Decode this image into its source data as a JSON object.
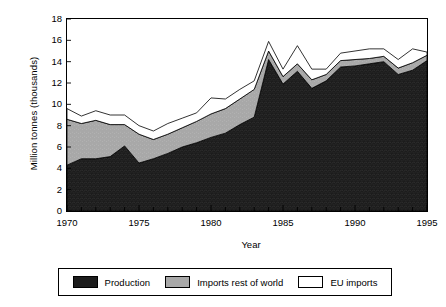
{
  "chart_data": {
    "type": "area",
    "stacked": true,
    "title": "",
    "xlabel": "Year",
    "ylabel": "Million tonnes (thousands)",
    "x": [
      1970,
      1971,
      1972,
      1973,
      1974,
      1975,
      1976,
      1977,
      1978,
      1979,
      1980,
      1981,
      1982,
      1983,
      1984,
      1985,
      1986,
      1987,
      1988,
      1989,
      1990,
      1991,
      1992,
      1993,
      1994,
      1995
    ],
    "xlim": [
      1970,
      1995
    ],
    "ylim": [
      0,
      18
    ],
    "ytick_labels": [
      "0",
      "2",
      "4",
      "6",
      "8",
      "10",
      "12",
      "14",
      "16",
      "18"
    ],
    "yticks": [
      0,
      2,
      4,
      6,
      8,
      10,
      12,
      14,
      16,
      18
    ],
    "xtick_labels": [
      "1970",
      "1975",
      "1980",
      "1985",
      "1990",
      "1995"
    ],
    "xticks": [
      1970,
      1975,
      1980,
      1985,
      1990,
      1995
    ],
    "xtick_minor_step": 1,
    "grid": false,
    "legend_position": "bottom",
    "series": [
      {
        "name": "Production",
        "color": "#1c1c1c",
        "values": [
          4.3,
          4.9,
          4.9,
          5.1,
          6.1,
          4.5,
          4.9,
          5.4,
          6.0,
          6.4,
          6.9,
          7.3,
          8.1,
          8.8,
          14.2,
          11.9,
          13.1,
          11.5,
          12.2,
          13.5,
          13.6,
          13.8,
          14.0,
          12.8,
          13.2,
          14.1
        ]
      },
      {
        "name": "Imports rest of world",
        "color": "#a8a8a8",
        "values": [
          4.3,
          3.3,
          3.6,
          3.0,
          2.0,
          2.7,
          1.8,
          1.8,
          1.8,
          2.0,
          2.2,
          2.3,
          2.4,
          2.6,
          0.8,
          0.7,
          0.7,
          0.8,
          0.6,
          0.6,
          0.6,
          0.5,
          0.5,
          0.6,
          0.7,
          0.5
        ]
      },
      {
        "name": "EU imports",
        "color": "#ffffff",
        "values": [
          1.0,
          0.7,
          0.9,
          0.9,
          0.9,
          0.8,
          0.8,
          1.0,
          0.9,
          0.8,
          1.5,
          0.9,
          0.9,
          0.8,
          0.9,
          0.7,
          1.7,
          1.0,
          0.5,
          0.7,
          0.8,
          0.9,
          0.7,
          0.8,
          1.3,
          0.3
        ]
      }
    ],
    "totals": [
      9.6,
      8.9,
      9.4,
      9.0,
      9.0,
      8.0,
      7.5,
      8.2,
      8.7,
      9.2,
      10.6,
      10.5,
      11.4,
      12.2,
      15.9,
      13.3,
      15.5,
      13.3,
      13.3,
      14.8,
      15.0,
      14.2,
      15.2,
      14.2,
      15.2,
      14.9
    ]
  },
  "axes": {
    "y_title": "Million tonnes (thousands)",
    "x_title": "Year"
  },
  "legend": {
    "entries": [
      {
        "label": "Production",
        "swatch": "production-swatch"
      },
      {
        "label": "Imports rest of world",
        "swatch": "imports-rest-of-world-swatch"
      },
      {
        "label": "EU imports",
        "swatch": "eu-imports-swatch"
      }
    ]
  }
}
